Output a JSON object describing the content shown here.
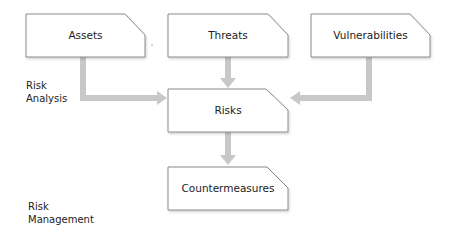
{
  "diagram": {
    "nodes": {
      "assets": {
        "label": "Assets"
      },
      "threats": {
        "label": "Threats"
      },
      "vulnerabilities": {
        "label": "Vulnerabilities"
      },
      "risks": {
        "label": "Risks"
      },
      "countermeasures": {
        "label": "Countermeasures"
      }
    },
    "sections": {
      "risk_analysis": {
        "line1": "Risk",
        "line2": "Analysis"
      },
      "risk_management": {
        "line1": "Risk",
        "line2": "Management"
      }
    },
    "edges": [
      {
        "from": "Assets",
        "to": "Risks"
      },
      {
        "from": "Threats",
        "to": "Risks"
      },
      {
        "from": "Vulnerabilities",
        "to": "Risks"
      },
      {
        "from": "Risks",
        "to": "Countermeasures"
      }
    ],
    "colors": {
      "box_border": "#8a8a8a",
      "box_fill": "#ffffff",
      "arrow": "#c8c8c8",
      "text": "#222222"
    }
  }
}
